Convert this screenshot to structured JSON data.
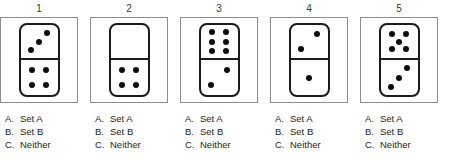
{
  "question_type": "domino-classification-multiple-choice",
  "answer_options": [
    {
      "key": "A.",
      "label": "Set A"
    },
    {
      "key": "B.",
      "label": "Set B"
    },
    {
      "key": "C.",
      "label": "Neither"
    }
  ],
  "items": [
    {
      "number": "1",
      "domino": {
        "top_pips": 3,
        "bottom_pips": 4
      },
      "options": [
        {
          "key": "A.",
          "label": "Set A"
        },
        {
          "key": "B.",
          "label": "Set B"
        },
        {
          "key": "C.",
          "label": "Neither"
        }
      ]
    },
    {
      "number": "2",
      "domino": {
        "top_pips": 0,
        "bottom_pips": 4
      },
      "options": [
        {
          "key": "A.",
          "label": "Set A"
        },
        {
          "key": "B.",
          "label": "Set B"
        },
        {
          "key": "C.",
          "label": "Neither"
        }
      ]
    },
    {
      "number": "3",
      "domino": {
        "top_pips": 6,
        "bottom_pips": 2
      },
      "options": [
        {
          "key": "A.",
          "label": "Set A"
        },
        {
          "key": "B.",
          "label": "Set B"
        },
        {
          "key": "C.",
          "label": "Neither"
        }
      ]
    },
    {
      "number": "4",
      "domino": {
        "top_pips": 2,
        "bottom_pips": 1
      },
      "options": [
        {
          "key": "A.",
          "label": "Set A"
        },
        {
          "key": "B.",
          "label": "Set B"
        },
        {
          "key": "C.",
          "label": "Neither"
        }
      ]
    },
    {
      "number": "5",
      "domino": {
        "top_pips": 5,
        "bottom_pips": 3
      },
      "options": [
        {
          "key": "A.",
          "label": "Set A"
        },
        {
          "key": "B.",
          "label": "Set B"
        },
        {
          "key": "C.",
          "label": "Neither"
        }
      ]
    }
  ],
  "colors": {
    "pip": "#0d0d0d",
    "domino_outline": "#1a1a1a",
    "cell_border": "#8d8d8d",
    "text": "#231f20",
    "number_text": "#3a3a3a",
    "background": "#ffffff"
  }
}
